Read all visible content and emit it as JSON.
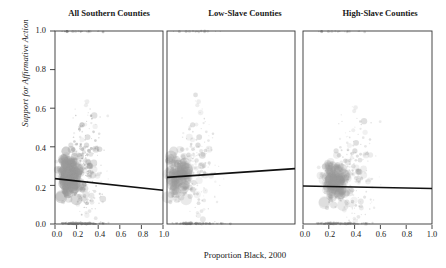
{
  "chart_data": {
    "type": "scatter",
    "title": "",
    "xlabel": "Proportion Black, 2000",
    "ylabel": "Support for Affirmative Action",
    "xlim": [
      0.0,
      1.0
    ],
    "ylim": [
      0.0,
      1.0
    ],
    "xticks": [
      "0.0",
      "0.2",
      "0.4",
      "0.6",
      "0.8",
      "1.0"
    ],
    "yticks": [
      "0.0",
      "0.2",
      "0.4",
      "0.6",
      "0.8",
      "1.0"
    ],
    "xtick_values": [
      0.0,
      0.2,
      0.4,
      0.6,
      0.8,
      1.0
    ],
    "ytick_values": [
      0.0,
      0.2,
      0.4,
      0.6,
      0.8,
      1.0
    ],
    "grid": false,
    "legend": "none",
    "point_color": "#9a9a9a",
    "line_color": "#111111",
    "axis_color": "#333333",
    "panels": [
      {
        "label": "All Southern Counties",
        "fit_line": {
          "x0": 0.0,
          "y0": 0.235,
          "x1": 1.0,
          "y1": 0.175,
          "slope": -0.06,
          "intercept": 0.235
        },
        "n_points": 1050,
        "cluster_center": [
          0.14,
          0.25
        ],
        "xtick_labels": [
          "0.0",
          "0.2",
          "0.4",
          "0.6",
          "0.8",
          "1.0"
        ]
      },
      {
        "label": "Low-Slave Counties",
        "fit_line": {
          "x0": 0.0,
          "y0": 0.242,
          "x1": 1.0,
          "y1": 0.287,
          "slope": 0.045,
          "intercept": 0.242
        },
        "n_points": 560,
        "cluster_center": [
          0.09,
          0.25
        ],
        "xtick_labels": [
          "0.0",
          "0.2",
          "0.4",
          "0.6",
          "0.8",
          "1.0"
        ]
      },
      {
        "label": "High-Slave Counties",
        "fit_line": {
          "x0": 0.0,
          "y0": 0.197,
          "x1": 1.0,
          "y1": 0.184,
          "slope": -0.013,
          "intercept": 0.197
        },
        "n_points": 620,
        "cluster_center": [
          0.25,
          0.22
        ],
        "xtick_labels": [
          "0.0",
          "0.2",
          "0.4",
          "0.6",
          "0.8",
          "1.0"
        ]
      }
    ]
  }
}
